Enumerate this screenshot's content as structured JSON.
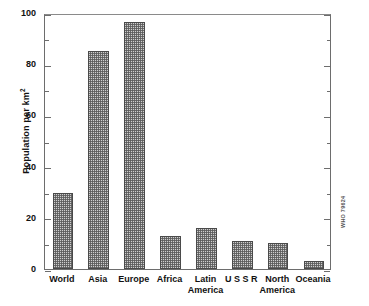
{
  "chart_data": {
    "type": "bar",
    "title": "",
    "subtitle": "",
    "xlabel": "",
    "ylabel": "Population per km2",
    "ylabel_base": "Population per km",
    "ylabel_exponent": "2",
    "categories": [
      "World",
      "Asia",
      "Europe",
      "Africa",
      "Latin\nAmerica",
      "U S S R",
      "North\nAmerica",
      "Oceania"
    ],
    "values": [
      29.5,
      85,
      96.5,
      13,
      16,
      11,
      10,
      3
    ],
    "ylim": [
      0,
      100
    ],
    "ytick_major": [
      0,
      20,
      40,
      60,
      80,
      100
    ],
    "ytick_major_labels": [
      "0",
      "20",
      "40",
      "60",
      "80",
      "100"
    ],
    "ytick_minor": [
      10,
      30,
      50,
      70,
      90
    ],
    "grid": false,
    "legend": false,
    "bar_fill": "#cfcfcf",
    "bar_edge": "#4a4a4a",
    "frame_color": "#6d6d6d",
    "background": "#ffffff"
  },
  "annotations": {
    "side_code": "WHO 79624"
  }
}
